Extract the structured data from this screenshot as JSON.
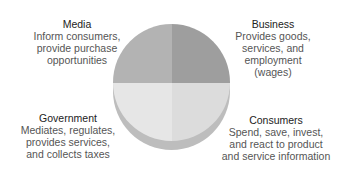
{
  "diagram": {
    "type": "quadrant-pie",
    "quadrants": [
      {
        "position": "top-left",
        "title": "Media",
        "lines": [
          "Inform consumers,",
          "provide purchase",
          "opportunities"
        ],
        "color": "#b3b3b3"
      },
      {
        "position": "top-right",
        "title": "Business",
        "lines": [
          "Provides goods,",
          "services, and",
          "employment",
          "(wages)"
        ],
        "color": "#9e9e9e"
      },
      {
        "position": "bottom-left",
        "title": "Government",
        "lines": [
          "Mediates, regulates,",
          "provides services,",
          "and collects taxes"
        ],
        "color": "#e6e6e6"
      },
      {
        "position": "bottom-right",
        "title": "Consumers",
        "lines": [
          "Spend, save, invest,",
          "and react to product",
          "and service information"
        ],
        "color": "#dcdcdc"
      }
    ]
  }
}
